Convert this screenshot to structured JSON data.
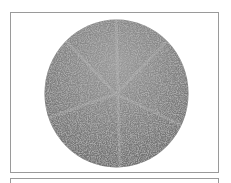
{
  "image": {
    "subject": "textured-circular-disc",
    "fill_color": "#7a7a7a",
    "highlight_color": "#bdbdbd",
    "frame_color": "#9a9a9a"
  }
}
